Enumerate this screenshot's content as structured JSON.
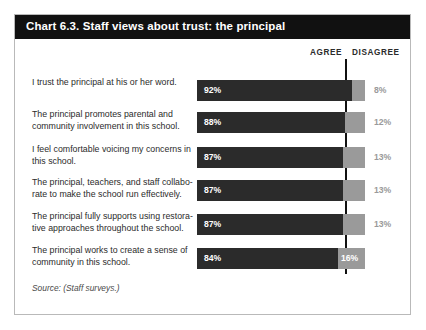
{
  "card": {
    "title": "Chart 6.3. Staff views about trust: the principal",
    "source": "Source: (Staff surveys.)"
  },
  "columns": {
    "agree": "AGREE",
    "disagree": "DISAGREE"
  },
  "colors": {
    "title_bar": "#111111",
    "agree_bar": "#2b2b2b",
    "disagree_bar": "#9a9a9a",
    "card_border": "#b9b9b9",
    "reference_line": "#111111",
    "page_background": "#ffffff"
  },
  "chart_data": {
    "type": "bar",
    "title": "Chart 6.3. Staff views about trust: the principal",
    "xlabel": "",
    "ylabel": "",
    "xlim": [
      0,
      100
    ],
    "grid": false,
    "legend_position": "top-right",
    "orientation": "horizontal",
    "stacked": true,
    "categories": [
      "I trust the principal at his or her word.",
      "The principal promotes parental and community involvement in this school.",
      "I feel comfortable voicing my concerns in this school.",
      "The principal, teachers, and staff collaborate to make the school run effectively.",
      "The principal fully supports using restorative approaches throughout the school.",
      "The principal works to create a sense of community in this school."
    ],
    "series": [
      {
        "name": "AGREE",
        "values": [
          92,
          88,
          87,
          87,
          87,
          84
        ]
      },
      {
        "name": "DISAGREE",
        "values": [
          8,
          12,
          13,
          13,
          13,
          16
        ]
      }
    ],
    "annotations": [
      "Source: (Staff surveys.)"
    ]
  },
  "rows": [
    {
      "label_line1": "I trust the principal at his or her word.",
      "label_line2": "",
      "agree": 92,
      "disagree": 8,
      "agree_text": "92%",
      "disagree_text": "8%",
      "disagree_inside": false
    },
    {
      "label_line1": "The principal promotes parental and",
      "label_line2": "community involvement in this school.",
      "agree": 88,
      "disagree": 12,
      "agree_text": "88%",
      "disagree_text": "12%",
      "disagree_inside": false
    },
    {
      "label_line1": "I feel comfortable voicing my concerns in",
      "label_line2": "this school.",
      "agree": 87,
      "disagree": 13,
      "agree_text": "87%",
      "disagree_text": "13%",
      "disagree_inside": false
    },
    {
      "label_line1": "The principal, teachers, and staff collabo-",
      "label_line2": "rate to make the school run effectively.",
      "agree": 87,
      "disagree": 13,
      "agree_text": "87%",
      "disagree_text": "13%",
      "disagree_inside": false
    },
    {
      "label_line1": "The principal fully supports using restora-",
      "label_line2": "tive approaches throughout the school.",
      "agree": 87,
      "disagree": 13,
      "agree_text": "87%",
      "disagree_text": "13%",
      "disagree_inside": false
    },
    {
      "label_line1": "The principal works to create a sense of",
      "label_line2": "community in this school.",
      "agree": 84,
      "disagree": 16,
      "agree_text": "84%",
      "disagree_text": "16%",
      "disagree_inside": true
    }
  ]
}
